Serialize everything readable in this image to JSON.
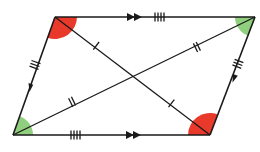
{
  "diagram": {
    "type": "parallelogram-with-diagonals",
    "vertices": {
      "top_left": [
        55,
        17
      ],
      "top_right": [
        255,
        17
      ],
      "bottom_left": [
        13,
        135
      ],
      "bottom_right": [
        210,
        135
      ]
    },
    "colors": {
      "line": "#1a1a1a",
      "angle_obtuse": "#e8392b",
      "angle_acute": "#8fcf7e",
      "background": "#ffffff"
    },
    "sides": [
      {
        "name": "top",
        "parallel_arrows": 2,
        "equal_ticks": 4
      },
      {
        "name": "bottom",
        "parallel_arrows": 2,
        "equal_ticks": 4
      },
      {
        "name": "left",
        "parallel_arrows": 1,
        "equal_ticks": 3
      },
      {
        "name": "right",
        "parallel_arrows": 1,
        "equal_ticks": 3
      }
    ],
    "diagonals": [
      {
        "name": "top-left-to-bottom-right",
        "half_ticks": 1
      },
      {
        "name": "bottom-left-to-top-right",
        "half_ticks": 2
      }
    ],
    "angles": [
      {
        "vertex": "top_left",
        "color": "red",
        "kind": "obtuse"
      },
      {
        "vertex": "bottom_right",
        "color": "red",
        "kind": "obtuse"
      },
      {
        "vertex": "top_right",
        "color": "green",
        "kind": "acute"
      },
      {
        "vertex": "bottom_left",
        "color": "green",
        "kind": "acute"
      }
    ]
  }
}
